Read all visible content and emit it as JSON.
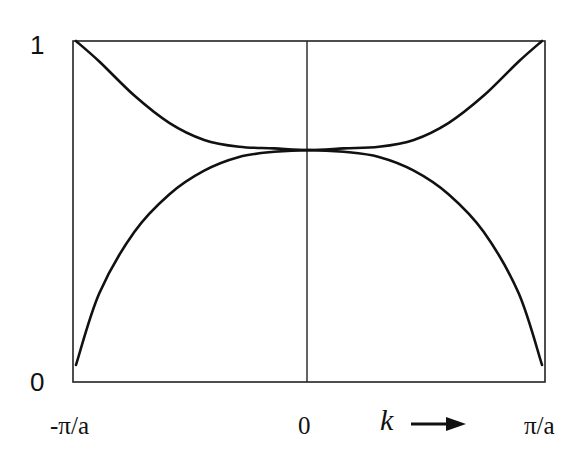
{
  "chart_data": {
    "type": "line",
    "title": "",
    "xlabel": "k",
    "ylabel": "",
    "x_ticks": [
      "-π/a",
      "0",
      "π/a"
    ],
    "y_ticks": [
      "0",
      "1"
    ],
    "xlim": [
      -1,
      1
    ],
    "ylim": [
      0,
      1
    ],
    "grid": false,
    "legend": null,
    "annotations": [
      "k →"
    ],
    "x": [
      -1.0,
      -0.9,
      -0.75,
      -0.6,
      -0.45,
      -0.3,
      -0.15,
      0.0,
      0.15,
      0.3,
      0.45,
      0.6,
      0.75,
      0.9,
      1.0
    ],
    "series": [
      {
        "name": "upper band",
        "values": [
          1.0,
          0.94,
          0.84,
          0.76,
          0.71,
          0.69,
          0.685,
          0.68,
          0.685,
          0.69,
          0.71,
          0.76,
          0.84,
          0.94,
          1.0
        ]
      },
      {
        "name": "lower band",
        "values": [
          0.05,
          0.26,
          0.44,
          0.55,
          0.62,
          0.66,
          0.675,
          0.68,
          0.675,
          0.66,
          0.62,
          0.55,
          0.44,
          0.26,
          0.05
        ]
      }
    ]
  },
  "labels": {
    "y_top": "1",
    "y_bottom": "0",
    "x_left": "-π/a",
    "x_center": "0",
    "x_right": "π/a",
    "x_axis_label": "k"
  }
}
